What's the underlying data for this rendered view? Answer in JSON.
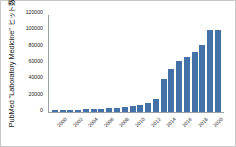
{
  "chart_data": {
    "type": "bar",
    "title": "",
    "subtitle": "",
    "xlabel": "",
    "ylabel": "PubMed \"Laboratory Medicine\" ヒット数",
    "ylim": [
      0,
      120000
    ],
    "ytick_values": [
      0,
      20000,
      40000,
      60000,
      80000,
      100000,
      120000
    ],
    "ytick_labels": [
      "0",
      "20000",
      "40000",
      "60000",
      "80000",
      "100000",
      "120000"
    ],
    "grid": false,
    "legend": false,
    "legend_position": "none",
    "bar_color": "#4472a8",
    "axis_color": "#9aa0a6",
    "categories": [
      "2000",
      "2001",
      "2002",
      "2003",
      "2004",
      "2005",
      "2006",
      "2007",
      "2008",
      "2009",
      "2010",
      "2011",
      "2012",
      "2013",
      "2014",
      "2015",
      "2016",
      "2017",
      "2018",
      "2019",
      "2020",
      "2021"
    ],
    "xtick_labels_shown": [
      "2000",
      "",
      "2002",
      "",
      "2004",
      "",
      "2006",
      "",
      "2008",
      "",
      "2010",
      "",
      "2012",
      "",
      "2014",
      "",
      "2016",
      "",
      "2018",
      "",
      "2020",
      ""
    ],
    "values": [
      2200,
      2300,
      2600,
      3000,
      3300,
      3900,
      4200,
      4600,
      5000,
      6000,
      7600,
      8700,
      11500,
      16500,
      40500,
      53500,
      62500,
      68500,
      74500,
      83000,
      102000,
      102000
    ]
  }
}
